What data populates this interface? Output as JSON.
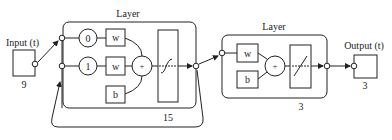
{
  "diagram": {
    "type": "recurrent-neural-network",
    "input": {
      "label": "Input (t)",
      "size": "9"
    },
    "hidden_layer": {
      "title": "Layer",
      "size": "15",
      "delay_taps": [
        "0",
        "1"
      ],
      "weight_labels": [
        "w",
        "w"
      ],
      "bias_label": "b",
      "sum_symbol": "+",
      "transfer": "tansig"
    },
    "output_layer": {
      "title": "Layer",
      "size": "3",
      "weight_label": "w",
      "bias_label": "b",
      "sum_symbol": "+",
      "transfer": "purelin"
    },
    "output": {
      "label": "Output (t)",
      "size": "3"
    },
    "colors": {
      "stroke": "#222222",
      "background": "#ffffff"
    }
  }
}
